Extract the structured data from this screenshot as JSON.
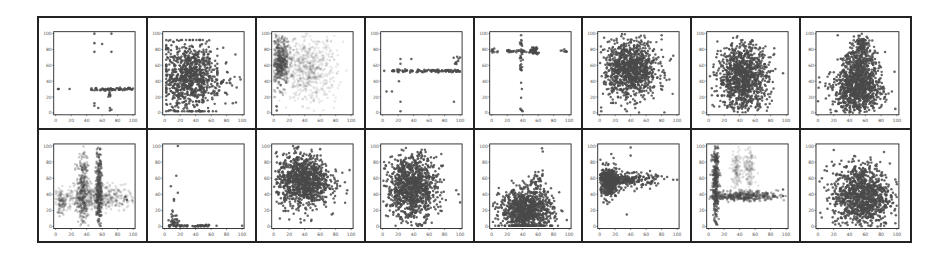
{
  "figure": {
    "rows": 2,
    "cols": 8,
    "point_color": "#4a4a4a",
    "axis_color": "#222222",
    "tick_values": [
      0,
      20,
      40,
      60,
      80,
      100
    ]
  },
  "chart_data": [
    {
      "type": "scatter",
      "panel": 1,
      "row": 1,
      "col": 1,
      "xlim": [
        0,
        100
      ],
      "ylim": [
        0,
        100
      ],
      "xticks": [
        0,
        20,
        40,
        60,
        80,
        100
      ],
      "yticks": [
        0,
        20,
        40,
        60,
        80,
        100
      ],
      "description": "Horizontal line of points at y≈30 from x≈45 to 100 plus few outliers",
      "lines": [
        {
          "x0": 45,
          "x1": 100,
          "y": 30,
          "n": 70,
          "jitter": 1
        }
      ],
      "clusters": [
        {
          "cx": 70,
          "cy": 22,
          "sx": 1,
          "sy": 3,
          "n": 8,
          "alpha": 0.8
        }
      ],
      "points": [
        [
          3,
          30
        ],
        [
          4,
          30
        ],
        [
          18,
          30
        ],
        [
          50,
          100
        ],
        [
          72,
          100
        ],
        [
          50,
          88
        ],
        [
          60,
          87
        ],
        [
          50,
          77
        ],
        [
          72,
          77
        ],
        [
          50,
          12
        ],
        [
          50,
          9
        ],
        [
          55,
          6
        ],
        [
          70,
          6
        ],
        [
          70,
          3
        ],
        [
          72,
          4
        ]
      ]
    },
    {
      "type": "scatter",
      "panel": 2,
      "row": 1,
      "col": 2,
      "xlim": [
        0,
        100
      ],
      "ylim": [
        0,
        100
      ],
      "xticks": [
        0,
        20,
        40,
        60,
        80,
        100
      ],
      "yticks": [
        0,
        20,
        40,
        60,
        80,
        100
      ],
      "description": "Dense block x 0–60, y 0–90 with sparse tail to x 100",
      "clusters": [
        {
          "cx": 32,
          "cy": 45,
          "sx": 17,
          "sy": 22,
          "n": 900,
          "alpha": 0.85,
          "xmin": 2,
          "xmax": 68,
          "ymin": 2,
          "ymax": 92
        },
        {
          "cx": 75,
          "cy": 35,
          "sx": 10,
          "sy": 18,
          "n": 40,
          "alpha": 0.85
        }
      ],
      "points": [
        [
          5,
          91
        ],
        [
          98,
          42
        ],
        [
          92,
          13
        ],
        [
          88,
          12
        ],
        [
          93,
          32
        ]
      ]
    },
    {
      "type": "scatter",
      "panel": 3,
      "row": 1,
      "col": 3,
      "xlim": [
        0,
        100
      ],
      "ylim": [
        0,
        100
      ],
      "xticks": [
        0,
        20,
        40,
        60,
        80,
        100
      ],
      "yticks": [
        0,
        20,
        40,
        60,
        80,
        100
      ],
      "description": "Dense dark band at x≈0–20, y 40–100; lighter diffuse cloud x 20–80, y 20–95",
      "clusters": [
        {
          "cx": 8,
          "cy": 65,
          "sx": 6,
          "sy": 15,
          "n": 500,
          "alpha": 0.35
        },
        {
          "cx": 45,
          "cy": 55,
          "sx": 18,
          "sy": 20,
          "n": 700,
          "alpha": 0.12
        }
      ],
      "points": [
        [
          4,
          8
        ],
        [
          4,
          3
        ],
        [
          9,
          35
        ]
      ]
    },
    {
      "type": "scatter",
      "panel": 4,
      "row": 1,
      "col": 4,
      "xlim": [
        0,
        100
      ],
      "ylim": [
        0,
        100
      ],
      "xticks": [
        0,
        20,
        40,
        60,
        80,
        100
      ],
      "yticks": [
        0,
        20,
        40,
        60,
        80,
        100
      ],
      "description": "Horizontal line at y≈53 from x≈15 to 100, few outliers",
      "lines": [
        {
          "x0": 12,
          "x1": 100,
          "y": 53,
          "n": 110,
          "jitter": 1
        }
      ],
      "clusters": [
        {
          "cx": 96,
          "cy": 63,
          "sx": 2,
          "sy": 4,
          "n": 8,
          "alpha": 0.9
        }
      ],
      "points": [
        [
          2,
          53
        ],
        [
          5,
          27
        ],
        [
          12,
          27
        ],
        [
          23,
          68
        ],
        [
          37,
          68
        ],
        [
          23,
          62
        ],
        [
          21,
          40
        ],
        [
          23,
          14
        ],
        [
          23,
          2
        ],
        [
          92,
          14
        ],
        [
          100,
          70
        ]
      ]
    },
    {
      "type": "scatter",
      "panel": 5,
      "row": 1,
      "col": 5,
      "xlim": [
        0,
        100
      ],
      "ylim": [
        0,
        100
      ],
      "xticks": [
        0,
        20,
        40,
        60,
        80,
        100
      ],
      "yticks": [
        0,
        20,
        40,
        60,
        80,
        100
      ],
      "description": "Cross shape: horizontal at y≈78, vertical at x≈38; big blob at (55,78)",
      "lines": [
        {
          "x0": 20,
          "x1": 55,
          "y": 78,
          "n": 40,
          "jitter": 1
        },
        {
          "x0": 0,
          "x1": 8,
          "y": 78,
          "n": 10,
          "jitter": 1.5
        },
        {
          "x0": 88,
          "x1": 98,
          "y": 78,
          "n": 8,
          "jitter": 1
        }
      ],
      "vlines": [
        {
          "y0": 50,
          "y1": 92,
          "x": 38,
          "n": 30,
          "jitter": 1
        }
      ],
      "clusters": [
        {
          "cx": 55,
          "cy": 78,
          "sx": 2.5,
          "sy": 2.5,
          "n": 40,
          "alpha": 0.9
        }
      ],
      "points": [
        [
          38,
          98
        ],
        [
          38,
          38
        ],
        [
          39,
          30
        ],
        [
          38,
          19
        ],
        [
          37,
          5
        ],
        [
          39,
          3
        ],
        [
          40,
          2
        ],
        [
          38,
          4
        ]
      ]
    },
    {
      "type": "scatter",
      "panel": 6,
      "row": 1,
      "col": 6,
      "xlim": [
        0,
        100
      ],
      "ylim": [
        0,
        100
      ],
      "xticks": [
        0,
        20,
        40,
        60,
        80,
        100
      ],
      "yticks": [
        0,
        20,
        40,
        60,
        80,
        100
      ],
      "description": "Dense cloud centered (40,55) spreading x 5–95, y 5–100",
      "clusters": [
        {
          "cx": 40,
          "cy": 55,
          "sx": 17,
          "sy": 18,
          "n": 1100,
          "alpha": 0.85
        }
      ],
      "points": [
        [
          2,
          2
        ],
        [
          35,
          2
        ],
        [
          80,
          98
        ],
        [
          95,
          72
        ],
        [
          92,
          68
        ],
        [
          90,
          42
        ]
      ]
    },
    {
      "type": "scatter",
      "panel": 7,
      "row": 1,
      "col": 7,
      "xlim": [
        0,
        100
      ],
      "ylim": [
        0,
        100
      ],
      "xticks": [
        0,
        20,
        40,
        60,
        80,
        100
      ],
      "yticks": [
        0,
        20,
        40,
        60,
        80,
        100
      ],
      "description": "Dense oval cloud centered (45,45), x 5–95, y 0–95",
      "clusters": [
        {
          "cx": 45,
          "cy": 45,
          "sx": 16,
          "sy": 21,
          "n": 1100,
          "alpha": 0.85
        }
      ],
      "points": [
        [
          6,
          58
        ],
        [
          5,
          10
        ],
        [
          96,
          50
        ]
      ]
    },
    {
      "type": "scatter",
      "panel": 8,
      "row": 1,
      "col": 8,
      "xlim": [
        0,
        100
      ],
      "ylim": [
        0,
        100
      ],
      "xticks": [
        0,
        20,
        40,
        60,
        80,
        100
      ],
      "yticks": [
        0,
        20,
        40,
        60,
        80,
        100
      ],
      "description": "Triangular/mountain-shaped cloud peaking at x≈50, y≈100",
      "clusters": [
        {
          "cx": 50,
          "cy": 28,
          "sx": 16,
          "sy": 14,
          "n": 800,
          "alpha": 0.85
        },
        {
          "cx": 52,
          "cy": 60,
          "sx": 10,
          "sy": 14,
          "n": 350,
          "alpha": 0.85
        },
        {
          "cx": 55,
          "cy": 85,
          "sx": 5,
          "sy": 7,
          "n": 90,
          "alpha": 0.85
        }
      ],
      "points": [
        [
          25,
          98
        ],
        [
          10,
          18
        ],
        [
          97,
          52
        ],
        [
          98,
          5
        ],
        [
          30,
          68
        ]
      ]
    },
    {
      "type": "scatter",
      "panel": 9,
      "row": 2,
      "col": 1,
      "xlim": [
        0,
        100
      ],
      "ylim": [
        0,
        100
      ],
      "xticks": [
        0,
        20,
        40,
        60,
        80,
        100
      ],
      "yticks": [
        0,
        20,
        40,
        60,
        80,
        100
      ],
      "description": "Vertical streaky bands at x≈35 (to 95) and x≈55 (to 100), diffuse mass y 20–45",
      "clusters": [
        {
          "cx": 35,
          "cy": 45,
          "sx": 4,
          "sy": 24,
          "n": 350,
          "alpha": 0.3
        },
        {
          "cx": 56,
          "cy": 50,
          "sx": 1.8,
          "sy": 27,
          "n": 250,
          "alpha": 0.55
        },
        {
          "cx": 50,
          "cy": 35,
          "sx": 28,
          "sy": 8,
          "n": 600,
          "alpha": 0.18
        },
        {
          "cx": 8,
          "cy": 30,
          "sx": 3,
          "sy": 8,
          "n": 60,
          "alpha": 0.3
        }
      ],
      "points": [
        [
          90,
          37
        ],
        [
          92,
          33
        ]
      ]
    },
    {
      "type": "scatter",
      "panel": 10,
      "row": 2,
      "col": 2,
      "xlim": [
        0,
        100
      ],
      "ylim": [
        0,
        100
      ],
      "xticks": [
        0,
        20,
        40,
        60,
        80,
        100
      ],
      "yticks": [
        0,
        20,
        40,
        60,
        80,
        100
      ],
      "description": "Points concentrated near y≈0 with x 0–60, sparse vertical outliers at x≈10–18",
      "lines": [
        {
          "x0": 3,
          "x1": 58,
          "y": 1,
          "n": 60,
          "jitter": 0.8
        }
      ],
      "clusters": [
        {
          "cx": 12,
          "cy": 6,
          "sx": 3,
          "sy": 5,
          "n": 40,
          "alpha": 0.85
        }
      ],
      "points": [
        [
          17,
          100
        ],
        [
          15,
          63
        ],
        [
          8,
          50
        ],
        [
          17,
          42
        ],
        [
          12,
          34
        ],
        [
          12,
          32
        ],
        [
          10,
          20
        ],
        [
          100,
          1
        ],
        [
          67,
          1
        ]
      ]
    },
    {
      "type": "scatter",
      "panel": 11,
      "row": 2,
      "col": 3,
      "xlim": [
        0,
        100
      ],
      "ylim": [
        0,
        100
      ],
      "xticks": [
        0,
        20,
        40,
        60,
        80,
        100
      ],
      "yticks": [
        0,
        20,
        40,
        60,
        80,
        100
      ],
      "description": "Dense round cloud centered (38,58)",
      "clusters": [
        {
          "cx": 38,
          "cy": 57,
          "sx": 17,
          "sy": 16,
          "n": 1100,
          "alpha": 0.85
        }
      ],
      "points": [
        [
          25,
          100
        ],
        [
          60,
          96
        ],
        [
          98,
          70
        ],
        [
          92,
          55
        ],
        [
          95,
          45
        ],
        [
          8,
          10
        ],
        [
          35,
          5
        ],
        [
          75,
          15
        ]
      ]
    },
    {
      "type": "scatter",
      "panel": 12,
      "row": 2,
      "col": 4,
      "xlim": [
        0,
        100
      ],
      "ylim": [
        0,
        100
      ],
      "xticks": [
        0,
        20,
        40,
        60,
        80,
        100
      ],
      "yticks": [
        0,
        20,
        40,
        60,
        80,
        100
      ],
      "description": "Dense cloud skewed to upper-left, centered (38,48)",
      "clusters": [
        {
          "cx": 38,
          "cy": 48,
          "sx": 16,
          "sy": 20,
          "n": 1100,
          "alpha": 0.85
        }
      ],
      "points": [
        [
          100,
          30
        ],
        [
          98,
          40
        ],
        [
          95,
          45
        ],
        [
          5,
          50
        ]
      ]
    },
    {
      "type": "scatter",
      "panel": 13,
      "row": 2,
      "col": 5,
      "xlim": [
        0,
        100
      ],
      "ylim": [
        0,
        100
      ],
      "xticks": [
        0,
        20,
        40,
        60,
        80,
        100
      ],
      "yticks": [
        0,
        20,
        40,
        60,
        80,
        100
      ],
      "description": "Dense cloud near bottom, centered (45,22), extending to y≈65",
      "clusters": [
        {
          "cx": 45,
          "cy": 20,
          "sx": 17,
          "sy": 13,
          "n": 1000,
          "alpha": 0.85,
          "ymin": 1
        },
        {
          "cx": 60,
          "cy": 55,
          "sx": 4,
          "sy": 6,
          "n": 40,
          "alpha": 0.85
        }
      ],
      "points": [
        [
          65,
          97
        ],
        [
          66,
          93
        ],
        [
          5,
          10
        ],
        [
          97,
          8
        ],
        [
          90,
          20
        ]
      ]
    },
    {
      "type": "scatter",
      "panel": 14,
      "row": 2,
      "col": 6,
      "xlim": [
        0,
        100
      ],
      "ylim": [
        0,
        100
      ],
      "xticks": [
        0,
        20,
        40,
        60,
        80,
        100
      ],
      "yticks": [
        0,
        20,
        40,
        60,
        80,
        100
      ],
      "description": "Comet-shaped cluster: head at (10,58), tail extending right along y≈58 to x≈95",
      "clusters": [
        {
          "cx": 12,
          "cy": 56,
          "sx": 7,
          "sy": 9,
          "n": 450,
          "alpha": 0.85
        },
        {
          "cx": 40,
          "cy": 58,
          "sx": 17,
          "sy": 4,
          "n": 200,
          "alpha": 0.85
        }
      ],
      "points": [
        [
          40,
          98
        ],
        [
          40,
          88
        ],
        [
          15,
          90
        ],
        [
          18,
          85
        ],
        [
          5,
          30
        ],
        [
          8,
          33
        ],
        [
          10,
          28
        ],
        [
          35,
          15
        ],
        [
          95,
          58
        ],
        [
          100,
          58
        ],
        [
          48,
          47
        ],
        [
          45,
          44
        ]
      ]
    },
    {
      "type": "scatter",
      "panel": 15,
      "row": 2,
      "col": 7,
      "xlim": [
        0,
        100
      ],
      "ylim": [
        0,
        100
      ],
      "xticks": [
        0,
        20,
        40,
        60,
        80,
        100
      ],
      "yticks": [
        0,
        20,
        40,
        60,
        80,
        100
      ],
      "description": "Dense vertical stripe at x≈8 (y 0–100), horizontal band y≈38 to x≈90, lighter vertical bands at x≈35 and x≈50",
      "clusters": [
        {
          "cx": 9,
          "cy": 55,
          "sx": 2.2,
          "sy": 25,
          "n": 300,
          "alpha": 0.6
        },
        {
          "cx": 45,
          "cy": 38,
          "sx": 22,
          "sy": 3,
          "n": 350,
          "alpha": 0.45
        },
        {
          "cx": 36,
          "cy": 70,
          "sx": 3,
          "sy": 12,
          "n": 120,
          "alpha": 0.15
        },
        {
          "cx": 52,
          "cy": 70,
          "sx": 4,
          "sy": 14,
          "n": 140,
          "alpha": 0.15
        }
      ],
      "points": [
        [
          96,
          46
        ],
        [
          96,
          38
        ],
        [
          9,
          5
        ],
        [
          10,
          3
        ]
      ]
    },
    {
      "type": "scatter",
      "panel": 16,
      "row": 2,
      "col": 8,
      "xlim": [
        0,
        100
      ],
      "ylim": [
        0,
        100
      ],
      "xticks": [
        0,
        20,
        40,
        60,
        80,
        100
      ],
      "yticks": [
        0,
        20,
        40,
        60,
        80,
        100
      ],
      "description": "Dense cloud centered (55,38) spreading x 0–100, y 0–100",
      "clusters": [
        {
          "cx": 55,
          "cy": 38,
          "sx": 18,
          "sy": 20,
          "n": 1100,
          "alpha": 0.85
        }
      ],
      "points": [
        [
          20,
          95
        ],
        [
          5,
          60
        ],
        [
          3,
          17
        ],
        [
          12,
          22
        ],
        [
          97,
          20
        ]
      ]
    }
  ]
}
